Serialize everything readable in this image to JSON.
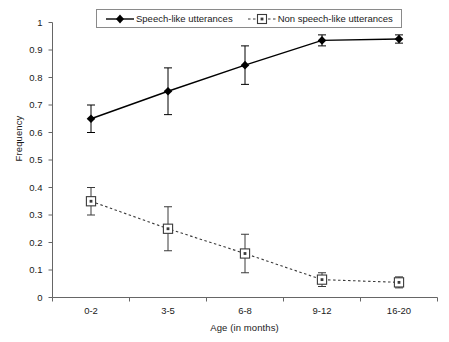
{
  "chart_data": {
    "type": "line",
    "title": "",
    "xlabel": "Age (in months)",
    "ylabel": "Frequency",
    "categories": [
      "0-2",
      "3-5",
      "6-8",
      "9-12",
      "16-20"
    ],
    "ylim": [
      0,
      1
    ],
    "yticks": [
      "0",
      "0.1",
      "0.2",
      "0.3",
      "0.4",
      "0.5",
      "0.6",
      "0.7",
      "0.8",
      "0.9",
      "1"
    ],
    "ytick_values": [
      0,
      0.1,
      0.2,
      0.3,
      0.4,
      0.5,
      0.6,
      0.7,
      0.8,
      0.9,
      1
    ],
    "grid": false,
    "legend_position": "top-center",
    "series": [
      {
        "name": "Speech-like utterances",
        "marker": "filled-diamond",
        "line_style": "solid",
        "color": "#000000",
        "values": [
          0.65,
          0.75,
          0.845,
          0.935,
          0.94
        ],
        "errors": [
          0.05,
          0.085,
          0.07,
          0.02,
          0.015
        ]
      },
      {
        "name": "Non speech-like utterances",
        "marker": "open-square",
        "line_style": "dashed",
        "color": "#3a3a3a",
        "values": [
          0.35,
          0.25,
          0.16,
          0.065,
          0.055
        ],
        "errors": [
          0.05,
          0.08,
          0.07,
          0.025,
          0.02
        ]
      }
    ]
  },
  "axes": {
    "y_title": "Frequency",
    "x_title": "Age (in months)"
  },
  "legend": {
    "entries": [
      {
        "label": "Speech-like utterances"
      },
      {
        "label": "Non speech-like utterances"
      }
    ]
  }
}
